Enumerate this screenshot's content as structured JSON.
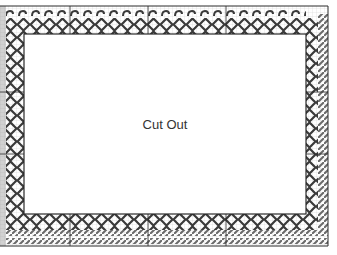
{
  "diagram": {
    "type": "needlepoint-chart",
    "center_label": "Cut Out",
    "colors": {
      "grid": "#c8c8c8",
      "stitch": "#3a3a3a",
      "frame": "#2a2a2a",
      "hatch": "#6a6a6a",
      "background": "#ffffff"
    },
    "border_patterns": [
      "s-curl-row",
      "diamond-chain",
      "diagonal-hatch-rows"
    ]
  }
}
